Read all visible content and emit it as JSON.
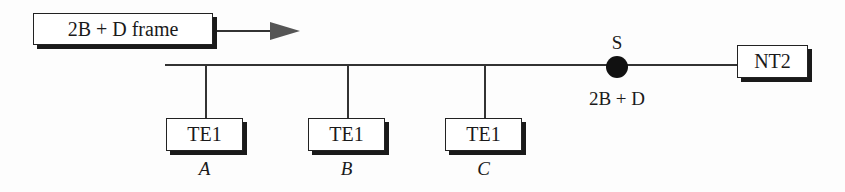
{
  "frame_box": {
    "label": "2B + D frame"
  },
  "bus": {
    "reference_point": {
      "label": "S",
      "sublabel": "2B + D"
    },
    "network_termination": {
      "label": "NT2"
    },
    "terminals": [
      {
        "label": "TE1",
        "name": "A"
      },
      {
        "label": "TE1",
        "name": "B"
      },
      {
        "label": "TE1",
        "name": "C"
      }
    ]
  },
  "colors": {
    "line": "#333333",
    "arrow": "#555555",
    "dot": "#111111"
  }
}
